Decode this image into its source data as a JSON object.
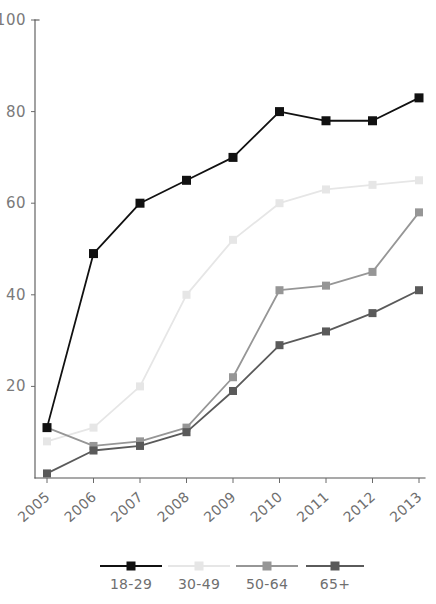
{
  "chart_data": {
    "type": "line",
    "title": "",
    "xlabel": "",
    "ylabel": "",
    "categories": [
      "2005",
      "2006",
      "2007",
      "2008",
      "2009",
      "2010",
      "2011",
      "2012",
      "2013"
    ],
    "ylim": [
      0,
      100
    ],
    "xlim_labels": [
      "2005",
      "2013"
    ],
    "ytick_labels": [
      "100",
      "80",
      "60",
      "40",
      "20"
    ],
    "yticks": [
      100,
      80,
      60,
      40,
      20
    ],
    "grid": false,
    "legend_position": "bottom",
    "series": [
      {
        "name": "18-29",
        "color": "#111111",
        "marker": "square",
        "values": [
          11,
          49,
          60,
          65,
          70,
          80,
          78,
          78,
          83
        ]
      },
      {
        "name": "30-49",
        "color": "#e6e6e6",
        "marker": "square",
        "values": [
          8,
          11,
          20,
          40,
          52,
          60,
          63,
          64,
          65
        ]
      },
      {
        "name": "50-64",
        "color": "#969696",
        "marker": "square",
        "values": [
          11,
          7,
          8,
          11,
          22,
          41,
          42,
          45,
          58
        ]
      },
      {
        "name": "65+",
        "color": "#5a5a5a",
        "marker": "square",
        "values": [
          1,
          6,
          7,
          10,
          19,
          29,
          32,
          36,
          41
        ]
      }
    ]
  },
  "legend": {
    "items": [
      {
        "label": "18-29",
        "color": "#111111"
      },
      {
        "label": "30-49",
        "color": "#e6e6e6"
      },
      {
        "label": "50-64",
        "color": "#969696"
      },
      {
        "label": "65+",
        "color": "#5a5a5a"
      }
    ]
  },
  "axes": {
    "y": {
      "ticks": [
        100,
        80,
        60,
        40,
        20
      ],
      "labels": [
        "100",
        "80",
        "60",
        "40",
        "20"
      ]
    },
    "x": {
      "labels": [
        "2005",
        "2006",
        "2007",
        "2008",
        "2009",
        "2010",
        "2011",
        "2012",
        "2013"
      ]
    }
  }
}
